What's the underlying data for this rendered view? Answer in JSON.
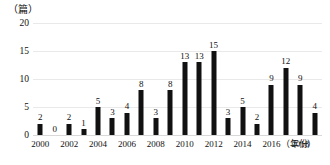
{
  "chart_data": {
    "type": "bar",
    "title": "",
    "subtitle": "",
    "xlabel": "（年份）",
    "ylabel": "（篇）",
    "ylim": [
      0,
      20
    ],
    "yticks": [
      0,
      5,
      10,
      15,
      20
    ],
    "ytick_labels": [
      "0",
      "5",
      "10",
      "15",
      "20"
    ],
    "grid": true,
    "grid_axis": "y",
    "legend": false,
    "legend_position": "none",
    "bar_color": "#111111",
    "gridline_color": "#e9e9e9",
    "categories": [
      "2000",
      "2001",
      "2002",
      "2003",
      "2004",
      "2005",
      "2006",
      "2007",
      "2008",
      "2009",
      "2010",
      "2011",
      "2012",
      "2013",
      "2014",
      "2015",
      "2016",
      "2017",
      "2018",
      "2019"
    ],
    "values": [
      2,
      0,
      2,
      1,
      5,
      3,
      4,
      8,
      3,
      8,
      13,
      13,
      15,
      3,
      5,
      2,
      9,
      12,
      9,
      4
    ],
    "data_labels": [
      "2",
      "0",
      "2",
      "1",
      "5",
      "3",
      "4",
      "8",
      "3",
      "8",
      "13",
      "13",
      "15",
      "3",
      "5",
      "2",
      "9",
      "12",
      "9",
      "4"
    ],
    "xtick_labels": [
      "2000",
      "2002",
      "2004",
      "2006",
      "2008",
      "2010",
      "2012",
      "2014",
      "2016",
      "2018"
    ],
    "xtick_categories": [
      "2000",
      "2002",
      "2004",
      "2006",
      "2008",
      "2010",
      "2012",
      "2014",
      "2016",
      "2018"
    ]
  }
}
